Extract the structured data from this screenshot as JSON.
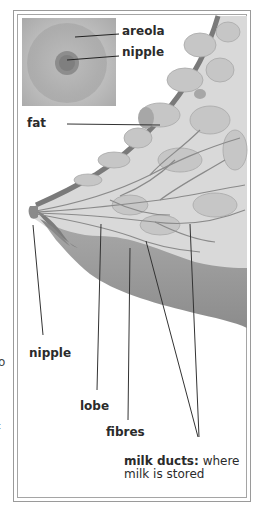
{
  "figure": {
    "type": "anatomical-diagram",
    "inset": {
      "labels": [
        {
          "id": "areola",
          "text": "areola"
        },
        {
          "id": "nipple",
          "text": "nipple"
        }
      ]
    },
    "labels": {
      "fat": "fat",
      "nipple": "nipple",
      "lobe": "lobe",
      "fibres": "fibres",
      "milk_ducts_bold": "milk ducts:",
      "milk_ducts_rest_1": " where",
      "milk_ducts_rest_2": "milk is stored"
    },
    "edge_fragments": [
      "o",
      "t"
    ],
    "colors": {
      "skin_outline": "#7a7a7a",
      "lobe_fill": "#9e9e9e",
      "tissue_fill": "#dcdcdc",
      "leader_line": "#333333",
      "frame": "#9a9a9a"
    }
  }
}
